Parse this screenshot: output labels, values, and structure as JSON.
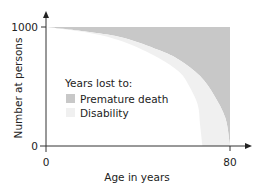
{
  "chart_data": {
    "type": "area",
    "title": "",
    "xlabel": "Age in years",
    "ylabel": "Number at persons",
    "xlim": [
      0,
      80
    ],
    "ylim": [
      0,
      1000
    ],
    "x_ticks": [
      "0",
      "80"
    ],
    "y_ticks": [
      "0",
      "1000"
    ],
    "grid": false,
    "legend": {
      "title": "Years lost to:",
      "position": "inside-center-left",
      "entries": [
        {
          "label": "Premature death",
          "color": "#c8c8c8"
        },
        {
          "label": "Disability",
          "color": "#f0f0f0"
        }
      ]
    },
    "series": [
      {
        "name": "Survival (healthy life boundary)",
        "role": "outer curve; area above is Premature death",
        "x": [
          0,
          19,
          34,
          49,
          58,
          67,
          73,
          78,
          80
        ],
        "values": [
          1000,
          958,
          908,
          807,
          723,
          588,
          429,
          235,
          0
        ]
      },
      {
        "name": "Disability-free survival",
        "role": "inner curve; area between curves is Disability",
        "x": [
          0,
          19,
          34,
          49,
          58,
          62,
          66,
          67,
          68
        ],
        "values": [
          1000,
          950,
          874,
          740,
          622,
          513,
          345,
          176,
          0
        ]
      }
    ]
  },
  "colors": {
    "premature_death": "#c8c8c8",
    "disability": "#f0f0f0",
    "axis": "#333333"
  }
}
